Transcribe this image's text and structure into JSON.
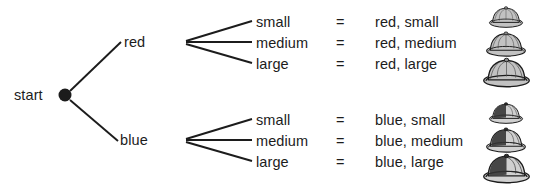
{
  "diagram": {
    "type": "probability-tree-diagram",
    "start_label": "start",
    "equals_sign": "=",
    "branches": [
      {
        "color_label": "red",
        "color_name": "red",
        "outcomes": [
          {
            "size_label": "small",
            "combo_label": "red, small",
            "hat_icon": "pith-helmet-icon",
            "hat_size": "small"
          },
          {
            "size_label": "medium",
            "combo_label": "red, medium",
            "hat_icon": "pith-helmet-icon",
            "hat_size": "medium"
          },
          {
            "size_label": "large",
            "combo_label": "red, large",
            "hat_icon": "pith-helmet-icon",
            "hat_size": "large"
          }
        ]
      },
      {
        "color_label": "blue",
        "color_name": "blue",
        "outcomes": [
          {
            "size_label": "small",
            "combo_label": "blue, small",
            "hat_icon": "pith-helmet-icon",
            "hat_size": "small"
          },
          {
            "size_label": "medium",
            "combo_label": "blue, medium",
            "hat_icon": "pith-helmet-icon",
            "hat_size": "medium"
          },
          {
            "size_label": "large",
            "combo_label": "blue, large",
            "hat_icon": "pith-helmet-icon",
            "hat_size": "large"
          }
        ]
      }
    ],
    "colors": {
      "line": "#1c1c1c",
      "text": "#1c1c1c",
      "background": "#ffffff",
      "hat_light_fill": "#b9b9b9",
      "hat_dark_fill": "#4a4a4a",
      "hat_outline": "#1c1c1c"
    }
  }
}
